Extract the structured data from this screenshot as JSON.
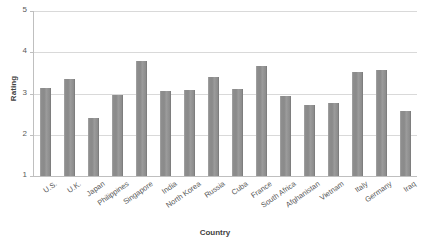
{
  "chart_data": {
    "type": "bar",
    "title": "",
    "xlabel": "Country",
    "ylabel": "Rating",
    "ylim": [
      1,
      5
    ],
    "yticks": [
      1,
      2,
      3,
      4,
      5
    ],
    "grid": true,
    "legend": "none",
    "categories": [
      "U.S.",
      "U.K.",
      "Japan",
      "Philippines",
      "Singapore",
      "India",
      "North Korea",
      "Russia",
      "Cuba",
      "France",
      "South Africa",
      "Afghanistan",
      "Vietnam",
      "Italy",
      "Germany",
      "Iraq"
    ],
    "values": [
      3.13,
      3.35,
      2.4,
      2.97,
      3.78,
      3.06,
      3.08,
      3.4,
      3.1,
      3.66,
      2.93,
      2.72,
      2.76,
      3.51,
      3.57,
      2.58
    ],
    "series": [
      {
        "name": "Rating",
        "color": "#8c8c8c",
        "values": [
          3.13,
          3.35,
          2.4,
          2.97,
          3.78,
          3.06,
          3.08,
          3.4,
          3.1,
          3.66,
          2.93,
          2.72,
          2.76,
          3.51,
          3.57,
          2.58
        ]
      }
    ]
  },
  "axes": {
    "y_title": "Rating",
    "x_title": "Country",
    "y_tick_labels": [
      "1",
      "2",
      "3",
      "4",
      "5"
    ]
  },
  "colors": {
    "bar": "#8c8c8c",
    "gridline": "#d9d9d9",
    "axis": "#bfbfbf",
    "text": "#595959",
    "title_text": "#3f3f3f",
    "background": "#ffffff"
  }
}
